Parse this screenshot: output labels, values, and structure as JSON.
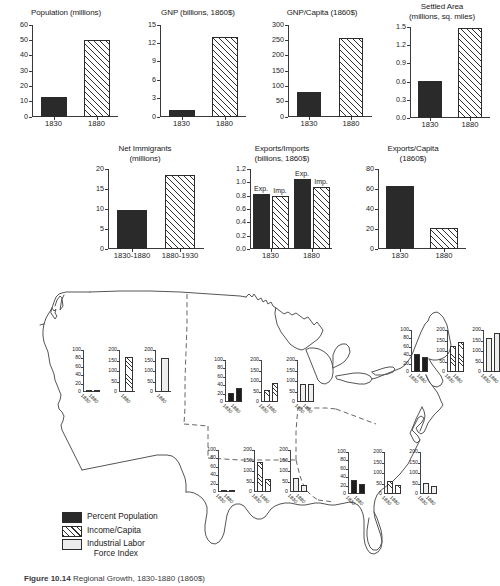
{
  "figure": {
    "caption_label": "Figure 10.14",
    "caption_text": "Regional Growth, 1830-1880 (1860$)"
  },
  "legend": {
    "items": [
      {
        "name": "percent-population",
        "label": "Percent Population",
        "swatch": "solid"
      },
      {
        "name": "income-per-capita",
        "label": "Income/Capita",
        "swatch": "hatch"
      },
      {
        "name": "industrial-labor-force-index",
        "label": "Industrial Labor\nForce Index",
        "swatch": "light"
      }
    ]
  },
  "chart_data": [
    {
      "id": "population",
      "type": "bar",
      "title": "Population (millions)",
      "categories": [
        "1830",
        "1880"
      ],
      "values": [
        13,
        50
      ],
      "fills": [
        "solid",
        "hatch"
      ],
      "ylim": [
        0,
        60
      ],
      "yticks": [
        0,
        10,
        20,
        30,
        40,
        50,
        60
      ],
      "ylabel": "",
      "xlabel": ""
    },
    {
      "id": "gnp",
      "type": "bar",
      "title": "GNP (billions, 1860$)",
      "categories": [
        "1830",
        "1880"
      ],
      "values": [
        1.0,
        13.0
      ],
      "fills": [
        "solid",
        "hatch"
      ],
      "ylim": [
        0,
        15
      ],
      "yticks": [
        0,
        3,
        6,
        9,
        12,
        15
      ],
      "ylabel": "",
      "xlabel": ""
    },
    {
      "id": "gnp-per-capita",
      "type": "bar",
      "title": "GNP/Capita (1860$)",
      "categories": [
        "1830",
        "1880"
      ],
      "values": [
        80,
        257
      ],
      "fills": [
        "solid",
        "hatch"
      ],
      "ylim": [
        0,
        300
      ],
      "yticks": [
        0,
        50,
        100,
        150,
        200,
        250,
        300
      ],
      "ylabel": "",
      "xlabel": ""
    },
    {
      "id": "settled-area",
      "type": "bar",
      "title": "Settled Area\n(millions, sq. miles)",
      "categories": [
        "1830",
        "1880"
      ],
      "values": [
        0.61,
        1.49
      ],
      "fills": [
        "solid",
        "hatch"
      ],
      "ylim": [
        0,
        1.5
      ],
      "yticks": [
        "0.0",
        "0.3",
        "0.6",
        "0.9",
        "1.2",
        "1.5"
      ],
      "ytickvals": [
        0,
        0.3,
        0.6,
        0.9,
        1.2,
        1.5
      ],
      "ylabel": "",
      "xlabel": ""
    },
    {
      "id": "net-immigrants",
      "type": "bar",
      "title": "Net Immigrants\n(millions)",
      "categories": [
        "1830-1880",
        "1880-1930"
      ],
      "values": [
        9.7,
        18.6
      ],
      "fills": [
        "solid",
        "hatch"
      ],
      "ylim": [
        0,
        20
      ],
      "yticks": [
        0,
        5,
        10,
        15,
        20
      ],
      "ylabel": "",
      "xlabel": ""
    },
    {
      "id": "exports-imports",
      "type": "bar",
      "title": "Exports/Imports\n(billions, 1860$)",
      "categories": [
        "1830",
        "1880"
      ],
      "series": [
        {
          "name": "Exp.",
          "values": [
            0.82,
            1.05
          ],
          "fill": "solid"
        },
        {
          "name": "Imp.",
          "values": [
            0.79,
            0.93
          ],
          "fill": "hatch"
        }
      ],
      "barlabels": [
        "Exp.",
        "Imp.",
        "Exp.",
        "Imp."
      ],
      "ylim": [
        0,
        1.2
      ],
      "yticks": [
        "0.0",
        "0.2",
        "0.4",
        "0.6",
        "0.8",
        "1.0",
        "1.2"
      ],
      "ytickvals": [
        0,
        0.2,
        0.4,
        0.6,
        0.8,
        1.0,
        1.2
      ],
      "ylabel": "",
      "xlabel": ""
    },
    {
      "id": "exports-per-capita",
      "type": "bar",
      "title": "Exports/Capita\n(1860$)",
      "categories": [
        "1830",
        "1880"
      ],
      "values": [
        63,
        21
      ],
      "fills": [
        "solid",
        "hatch"
      ],
      "ylim": [
        0,
        80
      ],
      "yticks": [
        0,
        20,
        40,
        60,
        80
      ],
      "ylabel": "",
      "xlabel": ""
    }
  ],
  "map": {
    "region_groups": [
      {
        "id": "west",
        "name": "west-region-charts",
        "charts": [
          {
            "metric": "Percent Population",
            "fill": "solid",
            "categories": [
              "1830",
              "1880"
            ],
            "values": [
              0,
              2
            ],
            "ylim": [
              0,
              100
            ],
            "yticks": [
              20,
              40,
              60,
              80,
              100
            ],
            "single": true
          },
          {
            "metric": "Income/Capita",
            "fill": "hatch",
            "categories": [
              "1880"
            ],
            "values": [
              168
            ],
            "ylim": [
              0,
              200
            ],
            "yticks": [
              50,
              100,
              150,
              200
            ],
            "single": true
          },
          {
            "metric": "Industrial Labor Force Index",
            "fill": "light",
            "categories": [
              "1880"
            ],
            "values": [
              160
            ],
            "ylim": [
              0,
              200
            ],
            "yticks": [
              50,
              100,
              150,
              200
            ],
            "single": true
          }
        ]
      },
      {
        "id": "midwest",
        "name": "midwest-region-charts",
        "charts": [
          {
            "metric": "Percent Population",
            "fill": "solid",
            "categories": [
              "1830",
              "1880"
            ],
            "values": [
              21,
              33
            ],
            "ylim": [
              0,
              100
            ],
            "yticks": [
              20,
              40,
              60,
              80,
              100
            ]
          },
          {
            "metric": "Income/Capita",
            "fill": "hatch",
            "categories": [
              "1830",
              "1880"
            ],
            "values": [
              58,
              90
            ],
            "ylim": [
              0,
              200
            ],
            "yticks": [
              50,
              100,
              150,
              200
            ]
          },
          {
            "metric": "Industrial Labor Force Index",
            "fill": "light",
            "categories": [
              "1830",
              "1880"
            ],
            "values": [
              84,
              86
            ],
            "ylim": [
              0,
              200
            ],
            "yticks": [
              50,
              100,
              150,
              200
            ]
          }
        ]
      },
      {
        "id": "northeast",
        "name": "northeast-region-charts",
        "charts": [
          {
            "metric": "Percent Population",
            "fill": "solid",
            "categories": [
              "1830",
              "1880"
            ],
            "values": [
              43,
              36
            ],
            "ylim": [
              0,
              100
            ],
            "yticks": [
              20,
              40,
              60,
              80,
              100
            ]
          },
          {
            "metric": "Income/Capita",
            "fill": "hatch",
            "categories": [
              "1830",
              "1880"
            ],
            "values": [
              126,
              141
            ],
            "ylim": [
              0,
              200
            ],
            "yticks": [
              50,
              100,
              150,
              200
            ]
          },
          {
            "metric": "Industrial Labor Force Index",
            "fill": "light",
            "categories": [
              "1830",
              "1880"
            ],
            "values": [
              161,
              186
            ],
            "ylim": [
              0,
              200
            ],
            "yticks": [
              50,
              100,
              150,
              200
            ]
          }
        ]
      },
      {
        "id": "south-central",
        "name": "south-central-region-charts",
        "charts": [
          {
            "metric": "Percent Population",
            "fill": "solid",
            "categories": [
              "1830",
              "1880"
            ],
            "values": [
              2,
              5
            ],
            "ylim": [
              0,
              100
            ],
            "yticks": [
              20,
              40,
              60,
              80,
              100
            ]
          },
          {
            "metric": "Income/Capita",
            "fill": "hatch",
            "categories": [
              "1830",
              "1880"
            ],
            "values": [
              144,
              61
            ],
            "ylim": [
              0,
              200
            ],
            "yticks": [
              50,
              100,
              150,
              200
            ]
          },
          {
            "metric": "Industrial Labor Force Index",
            "fill": "light",
            "categories": [
              "1830",
              "1880"
            ],
            "values": [
              66,
              33
            ],
            "ylim": [
              0,
              200
            ],
            "yticks": [
              50,
              100,
              150,
              200
            ]
          }
        ]
      },
      {
        "id": "southeast",
        "name": "southeast-region-charts",
        "charts": [
          {
            "metric": "Percent Population",
            "fill": "solid",
            "categories": [
              "1830",
              "1880"
            ],
            "values": [
              34,
              24
            ],
            "ylim": [
              0,
              100
            ],
            "yticks": [
              20,
              40,
              60,
              80,
              100
            ]
          },
          {
            "metric": "Income/Capita",
            "fill": "hatch",
            "categories": [
              "1830",
              "1880"
            ],
            "values": [
              62,
              44
            ],
            "ylim": [
              0,
              200
            ],
            "yticks": [
              50,
              100,
              150,
              200
            ]
          },
          {
            "metric": "Industrial Labor Force Index",
            "fill": "light",
            "categories": [
              "1830",
              "1880"
            ],
            "values": [
              52,
              37
            ],
            "ylim": [
              0,
              200
            ],
            "yticks": [
              50,
              100,
              150,
              200
            ]
          }
        ]
      }
    ]
  }
}
